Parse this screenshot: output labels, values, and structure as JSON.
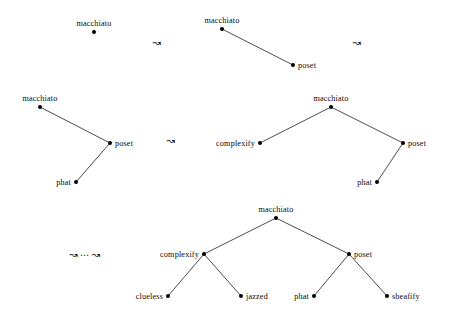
{
  "figure": {
    "type": "diagram",
    "subtype": "tree-rewriting-sequence",
    "background_color": "#ffffff",
    "ink_color": "#000000",
    "width": 452,
    "height": 318,
    "arrow_glyph": "↝",
    "ellipsis_glyph": "⋯"
  },
  "arrows": [
    {
      "id": "arrow-1",
      "symbol": "↝",
      "x": 157,
      "y": 43,
      "has_ellipsis": false
    },
    {
      "id": "arrow-2",
      "symbol": "↝",
      "x": 357,
      "y": 43,
      "has_ellipsis": false
    },
    {
      "id": "arrow-3",
      "symbol": "↝",
      "x": 171,
      "y": 141,
      "has_ellipsis": false
    },
    {
      "id": "arrow-4",
      "symbol": "↝",
      "x": 85,
      "y": 255,
      "has_ellipsis": true,
      "prefix": "↝",
      "ellipsis": "⋯",
      "suffix": "↝"
    }
  ],
  "trees": [
    {
      "id": "tree-1",
      "name": "tree-stage-1",
      "nodes": [
        {
          "id": "t1-macchiato",
          "label": "macchiato",
          "x": 94,
          "y": 32,
          "label_pos": "above"
        }
      ],
      "edges": []
    },
    {
      "id": "tree-2",
      "name": "tree-stage-2",
      "nodes": [
        {
          "id": "t2-macchiato",
          "label": "macchiato",
          "x": 222,
          "y": 29,
          "label_pos": "above"
        },
        {
          "id": "t2-poset",
          "label": "poset",
          "x": 293,
          "y": 65,
          "label_pos": "right"
        }
      ],
      "edges": [
        {
          "from": "t2-macchiato",
          "to": "t2-poset"
        }
      ]
    },
    {
      "id": "tree-3",
      "name": "tree-stage-3",
      "nodes": [
        {
          "id": "t3-macchiato",
          "label": "macchiato",
          "x": 40,
          "y": 107,
          "label_pos": "above"
        },
        {
          "id": "t3-poset",
          "label": "poset",
          "x": 110,
          "y": 143,
          "label_pos": "right"
        },
        {
          "id": "t3-phat",
          "label": "phat",
          "x": 76,
          "y": 182,
          "label_pos": "left"
        }
      ],
      "edges": [
        {
          "from": "t3-macchiato",
          "to": "t3-poset"
        },
        {
          "from": "t3-poset",
          "to": "t3-phat"
        }
      ]
    },
    {
      "id": "tree-4",
      "name": "tree-stage-4",
      "nodes": [
        {
          "id": "t4-macchiato",
          "label": "macchiato",
          "x": 331,
          "y": 107,
          "label_pos": "above"
        },
        {
          "id": "t4-complexify",
          "label": "complexify",
          "x": 260,
          "y": 143,
          "label_pos": "left"
        },
        {
          "id": "t4-poset",
          "label": "poset",
          "x": 403,
          "y": 143,
          "label_pos": "right"
        },
        {
          "id": "t4-phat",
          "label": "phat",
          "x": 377,
          "y": 182,
          "label_pos": "left"
        }
      ],
      "edges": [
        {
          "from": "t4-macchiato",
          "to": "t4-complexify"
        },
        {
          "from": "t4-macchiato",
          "to": "t4-poset"
        },
        {
          "from": "t4-poset",
          "to": "t4-phat"
        }
      ]
    },
    {
      "id": "tree-5",
      "name": "tree-stage-final",
      "nodes": [
        {
          "id": "t5-macchiato",
          "label": "macchiato",
          "x": 276,
          "y": 218,
          "label_pos": "above"
        },
        {
          "id": "t5-complexify",
          "label": "complexify",
          "x": 204,
          "y": 254,
          "label_pos": "left"
        },
        {
          "id": "t5-poset",
          "label": "poset",
          "x": 349,
          "y": 254,
          "label_pos": "right"
        },
        {
          "id": "t5-clueless",
          "label": "clueless",
          "x": 168,
          "y": 296,
          "label_pos": "left"
        },
        {
          "id": "t5-jazzed",
          "label": "jazzed",
          "x": 241,
          "y": 296,
          "label_pos": "right"
        },
        {
          "id": "t5-phat",
          "label": "phat",
          "x": 314,
          "y": 296,
          "label_pos": "left"
        },
        {
          "id": "t5-sheafify",
          "label": "sheafify",
          "x": 387,
          "y": 296,
          "label_pos": "right"
        }
      ],
      "edges": [
        {
          "from": "t5-macchiato",
          "to": "t5-complexify"
        },
        {
          "from": "t5-macchiato",
          "to": "t5-poset"
        },
        {
          "from": "t5-complexify",
          "to": "t5-clueless"
        },
        {
          "from": "t5-complexify",
          "to": "t5-jazzed"
        },
        {
          "from": "t5-poset",
          "to": "t5-phat"
        },
        {
          "from": "t5-poset",
          "to": "t5-sheafify"
        }
      ]
    }
  ]
}
